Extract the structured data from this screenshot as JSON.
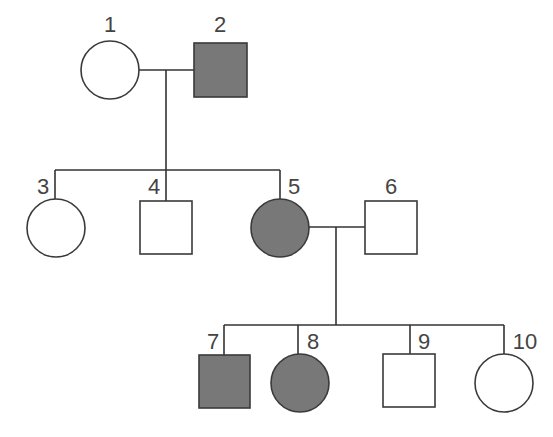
{
  "diagram": {
    "type": "pedigree",
    "colors": {
      "affected": "#787878",
      "unaffected": "#ffffff",
      "stroke": "#3a3a3a",
      "label": "#444444"
    },
    "individuals": [
      {
        "id": "1",
        "sex": "female",
        "affected": false,
        "generation": 1
      },
      {
        "id": "2",
        "sex": "male",
        "affected": true,
        "generation": 1
      },
      {
        "id": "3",
        "sex": "female",
        "affected": false,
        "generation": 2
      },
      {
        "id": "4",
        "sex": "male",
        "affected": false,
        "generation": 2
      },
      {
        "id": "5",
        "sex": "female",
        "affected": true,
        "generation": 2
      },
      {
        "id": "6",
        "sex": "male",
        "affected": false,
        "generation": 2
      },
      {
        "id": "7",
        "sex": "male",
        "affected": true,
        "generation": 3
      },
      {
        "id": "8",
        "sex": "female",
        "affected": true,
        "generation": 3
      },
      {
        "id": "9",
        "sex": "male",
        "affected": false,
        "generation": 3
      },
      {
        "id": "10",
        "sex": "female",
        "affected": false,
        "generation": 3
      }
    ],
    "matings": [
      {
        "partners": [
          "1",
          "2"
        ],
        "children": [
          "3",
          "4",
          "5"
        ]
      },
      {
        "partners": [
          "5",
          "6"
        ],
        "children": [
          "7",
          "8",
          "9",
          "10"
        ]
      }
    ]
  }
}
